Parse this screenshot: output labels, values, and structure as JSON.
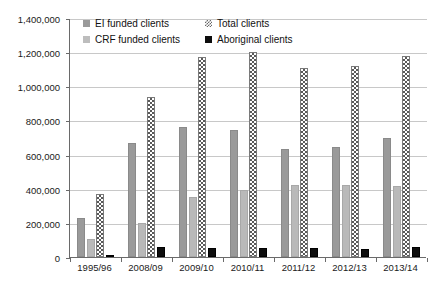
{
  "chart_data": {
    "type": "bar",
    "title": "",
    "subtitle": "",
    "xlabel": "",
    "ylabel": "",
    "ylim": [
      0,
      1400000
    ],
    "ytick_step": 200000,
    "grid": true,
    "legend_position": "top-inside",
    "categories": [
      "1995/96",
      "2008/09",
      "2009/10",
      "2010/11",
      "2011/12",
      "2012/13",
      "2013/14"
    ],
    "ytick_labels": [
      "1,400,000",
      "1,200,000",
      "1,000,000",
      "800,000",
      "600,000",
      "400,000",
      "200,000",
      "0"
    ],
    "ytick_values": [
      1400000,
      1200000,
      1000000,
      800000,
      600000,
      400000,
      200000,
      0
    ],
    "series": [
      {
        "name": "EI funded clients",
        "color": "#9a9a9a",
        "pattern": "solid",
        "values": [
          230000,
          670000,
          760000,
          745000,
          630000,
          645000,
          700000
        ]
      },
      {
        "name": "CRF funded clients",
        "color": "#b9b9b9",
        "pattern": "solid",
        "values": [
          105000,
          200000,
          350000,
          390000,
          420000,
          420000,
          415000
        ]
      },
      {
        "name": "Total clients",
        "color": "#5a5a5a",
        "pattern": "checkered",
        "values": [
          370000,
          935000,
          1170000,
          1200000,
          1110000,
          1120000,
          1175000
        ]
      },
      {
        "name": "Aboriginal clients",
        "color": "#0d0d0d",
        "pattern": "solid",
        "values": [
          12000,
          60000,
          50000,
          50000,
          50000,
          45000,
          58000
        ]
      }
    ]
  },
  "legend": {
    "items": [
      {
        "label": "EI funded clients",
        "swatch": "ei-swatch"
      },
      {
        "label": "Total clients",
        "swatch": "total-swatch"
      },
      {
        "label": "CRF funded clients",
        "swatch": "crf-swatch"
      },
      {
        "label": "Aboriginal clients",
        "swatch": "aboriginal-swatch"
      }
    ]
  }
}
